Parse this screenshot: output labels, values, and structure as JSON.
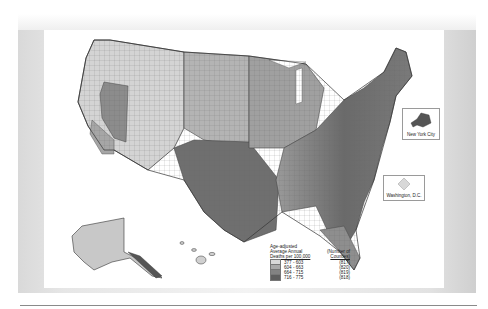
{
  "map": {
    "subject": "Age-adjusted average annual deaths per 100,000 by US county",
    "insets": {
      "nyc": {
        "label": "New York City"
      },
      "dc": {
        "label": "Washington, D.C."
      }
    },
    "legend": {
      "title_line1": "Age-adjusted",
      "title_line2": "Average Annual",
      "title_line3": "Deaths per 100,000",
      "count_header_line1": "(Number of",
      "count_header_line2": "Counties)",
      "items": [
        {
          "range": "377 - 603",
          "count": "(817)",
          "color": "#d8d8d8"
        },
        {
          "range": "604 - 663",
          "count": "(820)",
          "color": "#a8a8a8"
        },
        {
          "range": "664 - 715",
          "count": "(819)",
          "color": "#828282"
        },
        {
          "range": "716 - 775",
          "count": "(818)",
          "color": "#5e5e5e"
        }
      ]
    },
    "colors": {
      "low": "#d8d8d8",
      "mid_low": "#a8a8a8",
      "mid_high": "#828282",
      "high": "#5e5e5e",
      "border": "#444444"
    }
  }
}
